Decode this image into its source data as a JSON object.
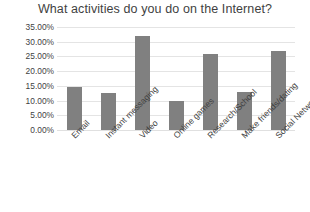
{
  "chart_data": {
    "type": "bar",
    "title": "What activities do you do on the Internet?",
    "xlabel": "",
    "ylabel": "",
    "categories": [
      "Email",
      "Instant messaging",
      "Video",
      "Online games",
      "Research/School",
      "Make friends/dating",
      "Social Networks"
    ],
    "values": [
      14.5,
      12.5,
      32.0,
      10.0,
      26.0,
      13.0,
      27.0
    ],
    "value_labels": [
      "14.50%",
      "12.50%",
      "32.00%",
      "10.00%",
      "26.00%",
      "13.00%",
      "27.00%"
    ],
    "ylim": [
      0,
      35
    ],
    "ytick_labels": [
      "35.00%",
      "30.00%",
      "25.00%",
      "20.00%",
      "15.00%",
      "10.00%",
      "5.00%",
      "0.00%"
    ],
    "ytick_values": [
      35,
      30,
      25,
      20,
      15,
      10,
      5,
      0
    ],
    "grid": true,
    "legend": false,
    "legend_position": "none",
    "series_color": "#808080",
    "gridline_color": "#e4e4e4",
    "text_color": "#3f3f3f",
    "background": "#ffffff"
  }
}
